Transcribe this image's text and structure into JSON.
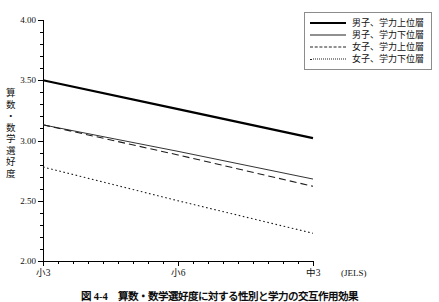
{
  "figure": {
    "caption": "図 4-4　算数・数学選好度に対する性別と学力の交互作用効果",
    "source_note": "(JELS)"
  },
  "legend": {
    "items": [
      {
        "label": "男子、学力上位層",
        "style": "thick-solid"
      },
      {
        "label": "男子、学力下位層",
        "style": "thin-solid"
      },
      {
        "label": "女子、学力上位層",
        "style": "dashed"
      },
      {
        "label": "女子、学力下位層",
        "style": "dotted"
      }
    ]
  },
  "chart_data": {
    "type": "line",
    "title": "",
    "xlabel": "",
    "ylabel": "算数・数学選好度",
    "ylabel_chars": [
      "算",
      "数",
      "・",
      "数",
      "学",
      "選",
      "好",
      "度"
    ],
    "categories": [
      "小3",
      "小6",
      "中3"
    ],
    "x": [
      0,
      1,
      2
    ],
    "ylim": [
      2.0,
      4.0
    ],
    "yticks": [
      "4.00",
      "3.50",
      "3.00",
      "2.50",
      "2.00"
    ],
    "ytick_values": [
      4.0,
      3.5,
      3.0,
      2.5,
      2.0
    ],
    "ytick_minor_step": 0.1,
    "grid": false,
    "legend_position": "top-right",
    "series": [
      {
        "name": "男子、学力上位層",
        "style": "thick-solid",
        "values": [
          3.5,
          3.26,
          3.02
        ]
      },
      {
        "name": "男子、学力下位層",
        "style": "thin-solid",
        "values": [
          3.13,
          2.91,
          2.68
        ]
      },
      {
        "name": "女子、学力上位層",
        "style": "dashed",
        "values": [
          3.13,
          2.88,
          2.62
        ]
      },
      {
        "name": "女子、学力下位層",
        "style": "dotted",
        "values": [
          2.78,
          2.5,
          2.23
        ]
      }
    ]
  }
}
